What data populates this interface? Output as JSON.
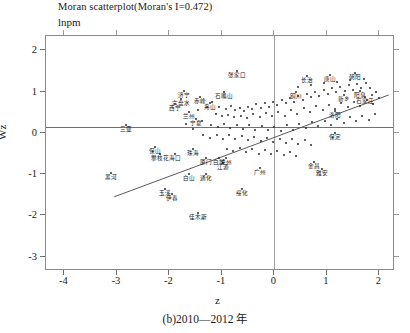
{
  "chart_data": {
    "type": "scatter",
    "title": "Moran scatterplot(Moran's I=0.472)",
    "subtitle": "lnpm",
    "xlabel": "z",
    "ylabel": "Wz",
    "caption": "(b)2010—2012 年",
    "morans_i": 0.472,
    "xlim": [
      -4.35,
      2.3
    ],
    "ylim": [
      -3.35,
      2.35
    ],
    "xticks": [
      -4,
      -3,
      -2,
      -1,
      0,
      1,
      2
    ],
    "yticks": [
      2,
      1,
      0,
      -1,
      -2,
      -3
    ],
    "grid": false,
    "legend": "none",
    "reference_lines": {
      "horizontal_y": 0.15,
      "vertical_x": 0.0
    },
    "fit_line": {
      "x_start": -3.05,
      "y_start": -1.55,
      "x_end": 2.18,
      "y_end": 0.92
    },
    "points": [
      {
        "label": "张家口",
        "x": -0.72,
        "y": 1.5
      },
      {
        "label": "长治",
        "x": 0.62,
        "y": 1.37
      },
      {
        "label": "唐山",
        "x": 1.07,
        "y": 1.4
      },
      {
        "label": "朝阳",
        "x": 1.53,
        "y": 1.45
      },
      {
        "label": "济宁",
        "x": -1.72,
        "y": 1.02
      },
      {
        "label": "石嘴山",
        "x": -0.96,
        "y": 0.98
      },
      {
        "label": "铜川",
        "x": 0.42,
        "y": 1.0
      },
      {
        "label": "阳泉",
        "x": 1.64,
        "y": 1.02
      },
      {
        "label": "赤峰",
        "x": -1.42,
        "y": 0.88
      },
      {
        "label": "六盘水",
        "x": -1.78,
        "y": 0.82
      },
      {
        "label": "舟山",
        "x": -1.22,
        "y": 0.72
      },
      {
        "label": "西宁",
        "x": -1.9,
        "y": 0.7
      },
      {
        "label": "石家庄",
        "x": 1.72,
        "y": 0.86
      },
      {
        "label": "新乡",
        "x": 1.33,
        "y": 0.92
      },
      {
        "label": "兰州",
        "x": -1.62,
        "y": 0.5
      },
      {
        "label": "宁夏",
        "x": -1.5,
        "y": 0.33
      },
      {
        "label": "洛阳",
        "x": 1.16,
        "y": 0.52
      },
      {
        "label": "三亚",
        "x": -2.82,
        "y": 0.2
      },
      {
        "label": "保定",
        "x": 1.15,
        "y": 0.0
      },
      {
        "label": "保山",
        "x": -2.28,
        "y": -0.35
      },
      {
        "label": "海口",
        "x": -1.9,
        "y": -0.5
      },
      {
        "label": "攀枝花",
        "x": -2.18,
        "y": -0.52
      },
      {
        "label": "珠海",
        "x": -1.55,
        "y": -0.4
      },
      {
        "label": "厦门",
        "x": -1.3,
        "y": -0.6
      },
      {
        "label": "泸州",
        "x": -0.92,
        "y": -0.62
      },
      {
        "label": "白城",
        "x": -1.05,
        "y": -0.62
      },
      {
        "label": "江源",
        "x": -0.98,
        "y": -0.74
      },
      {
        "label": "广州",
        "x": -0.28,
        "y": -0.85
      },
      {
        "label": "金昌",
        "x": 0.75,
        "y": -0.7
      },
      {
        "label": "雅安",
        "x": 0.9,
        "y": -0.88
      },
      {
        "label": "黑河",
        "x": -3.12,
        "y": -0.98
      },
      {
        "label": "白山",
        "x": -1.62,
        "y": -1.0
      },
      {
        "label": "通化",
        "x": -1.3,
        "y": -1.0
      },
      {
        "label": "玉溪",
        "x": -2.08,
        "y": -1.35
      },
      {
        "label": "伊春",
        "x": -1.95,
        "y": -1.48
      },
      {
        "label": "绥化",
        "x": -0.62,
        "y": -1.35
      },
      {
        "label": "佳木斯",
        "x": -1.45,
        "y": -1.95
      }
    ],
    "cluster_points": [
      {
        "x": -1.05,
        "y": 0.62
      },
      {
        "x": -0.92,
        "y": 0.58
      },
      {
        "x": -0.82,
        "y": 0.66
      },
      {
        "x": -0.74,
        "y": 0.55
      },
      {
        "x": -0.66,
        "y": 0.6
      },
      {
        "x": -0.58,
        "y": 0.52
      },
      {
        "x": -0.5,
        "y": 0.64
      },
      {
        "x": -0.42,
        "y": 0.57
      },
      {
        "x": -0.34,
        "y": 0.7
      },
      {
        "x": -0.26,
        "y": 0.6
      },
      {
        "x": -0.18,
        "y": 0.72
      },
      {
        "x": -0.1,
        "y": 0.64
      },
      {
        "x": -0.02,
        "y": 0.75
      },
      {
        "x": 0.06,
        "y": 0.68
      },
      {
        "x": 0.14,
        "y": 0.8
      },
      {
        "x": 0.22,
        "y": 0.72
      },
      {
        "x": 0.3,
        "y": 0.85
      },
      {
        "x": 0.38,
        "y": 0.76
      },
      {
        "x": 0.46,
        "y": 0.9
      },
      {
        "x": 0.54,
        "y": 0.8
      },
      {
        "x": 0.62,
        "y": 0.95
      },
      {
        "x": 0.7,
        "y": 0.86
      },
      {
        "x": 0.78,
        "y": 1.0
      },
      {
        "x": 0.86,
        "y": 0.9
      },
      {
        "x": 0.94,
        "y": 1.05
      },
      {
        "x": 1.02,
        "y": 0.95
      },
      {
        "x": 1.1,
        "y": 1.08
      },
      {
        "x": 1.18,
        "y": 0.98
      },
      {
        "x": 1.26,
        "y": 1.12
      },
      {
        "x": 1.34,
        "y": 1.02
      },
      {
        "x": 1.42,
        "y": 1.15
      },
      {
        "x": 1.5,
        "y": 1.05
      },
      {
        "x": 1.58,
        "y": 1.18
      },
      {
        "x": 1.66,
        "y": 1.08
      },
      {
        "x": 1.74,
        "y": 1.2
      },
      {
        "x": 1.82,
        "y": 1.1
      },
      {
        "x": -1.12,
        "y": 0.45
      },
      {
        "x": -1.0,
        "y": 0.4
      },
      {
        "x": -0.88,
        "y": 0.44
      },
      {
        "x": -0.76,
        "y": 0.38
      },
      {
        "x": -0.64,
        "y": 0.42
      },
      {
        "x": -0.52,
        "y": 0.36
      },
      {
        "x": -0.4,
        "y": 0.45
      },
      {
        "x": -0.28,
        "y": 0.38
      },
      {
        "x": -0.16,
        "y": 0.48
      },
      {
        "x": -0.04,
        "y": 0.4
      },
      {
        "x": 0.08,
        "y": 0.5
      },
      {
        "x": 0.2,
        "y": 0.42
      },
      {
        "x": 0.32,
        "y": 0.55
      },
      {
        "x": 0.44,
        "y": 0.46
      },
      {
        "x": 0.56,
        "y": 0.6
      },
      {
        "x": 0.68,
        "y": 0.5
      },
      {
        "x": 0.8,
        "y": 0.65
      },
      {
        "x": 0.92,
        "y": 0.55
      },
      {
        "x": 1.04,
        "y": 0.68
      },
      {
        "x": 1.16,
        "y": 0.58
      },
      {
        "x": 1.28,
        "y": 0.72
      },
      {
        "x": 1.4,
        "y": 0.62
      },
      {
        "x": 1.52,
        "y": 0.76
      },
      {
        "x": 1.64,
        "y": 0.66
      },
      {
        "x": 1.76,
        "y": 0.8
      },
      {
        "x": 1.88,
        "y": 0.7
      },
      {
        "x": -1.2,
        "y": 0.2
      },
      {
        "x": -1.08,
        "y": 0.15
      },
      {
        "x": -0.96,
        "y": 0.22
      },
      {
        "x": -0.84,
        "y": 0.12
      },
      {
        "x": -0.72,
        "y": 0.2
      },
      {
        "x": -0.6,
        "y": 0.1
      },
      {
        "x": -0.48,
        "y": 0.18
      },
      {
        "x": -0.36,
        "y": 0.08
      },
      {
        "x": -0.24,
        "y": 0.16
      },
      {
        "x": -0.12,
        "y": 0.06
      },
      {
        "x": 0.0,
        "y": 0.14
      },
      {
        "x": 0.12,
        "y": 0.04
      },
      {
        "x": 0.24,
        "y": 0.18
      },
      {
        "x": 0.36,
        "y": 0.08
      },
      {
        "x": 0.48,
        "y": 0.22
      },
      {
        "x": 0.6,
        "y": 0.12
      },
      {
        "x": 0.72,
        "y": 0.26
      },
      {
        "x": 0.84,
        "y": 0.16
      },
      {
        "x": 0.96,
        "y": 0.3
      },
      {
        "x": 1.08,
        "y": 0.2
      },
      {
        "x": 1.2,
        "y": 0.34
      },
      {
        "x": 1.32,
        "y": 0.24
      },
      {
        "x": 1.44,
        "y": 0.38
      },
      {
        "x": 1.56,
        "y": 0.28
      },
      {
        "x": 1.68,
        "y": 0.42
      },
      {
        "x": 1.8,
        "y": 0.32
      },
      {
        "x": 1.92,
        "y": 0.45
      },
      {
        "x": -1.35,
        "y": -0.05
      },
      {
        "x": -1.22,
        "y": -0.12
      },
      {
        "x": -1.1,
        "y": -0.04
      },
      {
        "x": -0.98,
        "y": -0.14
      },
      {
        "x": -0.86,
        "y": -0.06
      },
      {
        "x": -0.74,
        "y": -0.16
      },
      {
        "x": -0.62,
        "y": -0.08
      },
      {
        "x": -0.5,
        "y": -0.18
      },
      {
        "x": -0.38,
        "y": -0.1
      },
      {
        "x": -0.26,
        "y": -0.2
      },
      {
        "x": -0.14,
        "y": -0.12
      },
      {
        "x": -0.02,
        "y": -0.22
      },
      {
        "x": 0.1,
        "y": -0.14
      },
      {
        "x": 0.22,
        "y": -0.24
      },
      {
        "x": 0.34,
        "y": -0.16
      },
      {
        "x": 0.46,
        "y": -0.26
      },
      {
        "x": 0.58,
        "y": -0.18
      },
      {
        "x": 0.7,
        "y": -0.3
      },
      {
        "x": -0.9,
        "y": -0.38
      },
      {
        "x": -0.78,
        "y": -0.44
      },
      {
        "x": -0.66,
        "y": -0.36
      },
      {
        "x": -0.54,
        "y": -0.46
      },
      {
        "x": -0.42,
        "y": -0.4
      },
      {
        "x": -0.3,
        "y": -0.5
      },
      {
        "x": -0.18,
        "y": -0.42
      },
      {
        "x": -0.06,
        "y": -0.52
      },
      {
        "x": 0.06,
        "y": -0.44
      },
      {
        "x": 0.18,
        "y": -0.54
      },
      {
        "x": 0.3,
        "y": -0.46
      },
      {
        "x": 0.42,
        "y": -0.56
      },
      {
        "x": -1.45,
        "y": 0.55
      },
      {
        "x": -1.38,
        "y": 0.3
      },
      {
        "x": -1.28,
        "y": 0.62
      },
      {
        "x": -1.55,
        "y": 0.1
      },
      {
        "x": -1.68,
        "y": 0.22
      },
      {
        "x": -1.18,
        "y": 0.75
      },
      {
        "x": 1.86,
        "y": 0.92
      },
      {
        "x": 1.94,
        "y": 1.0
      },
      {
        "x": 2.0,
        "y": 0.85
      },
      {
        "x": 1.7,
        "y": 1.3
      },
      {
        "x": 1.45,
        "y": 1.28
      },
      {
        "x": 1.2,
        "y": 1.24
      },
      {
        "x": 0.95,
        "y": 1.2
      },
      {
        "x": 0.7,
        "y": 1.16
      },
      {
        "x": 0.45,
        "y": 1.12
      }
    ]
  }
}
